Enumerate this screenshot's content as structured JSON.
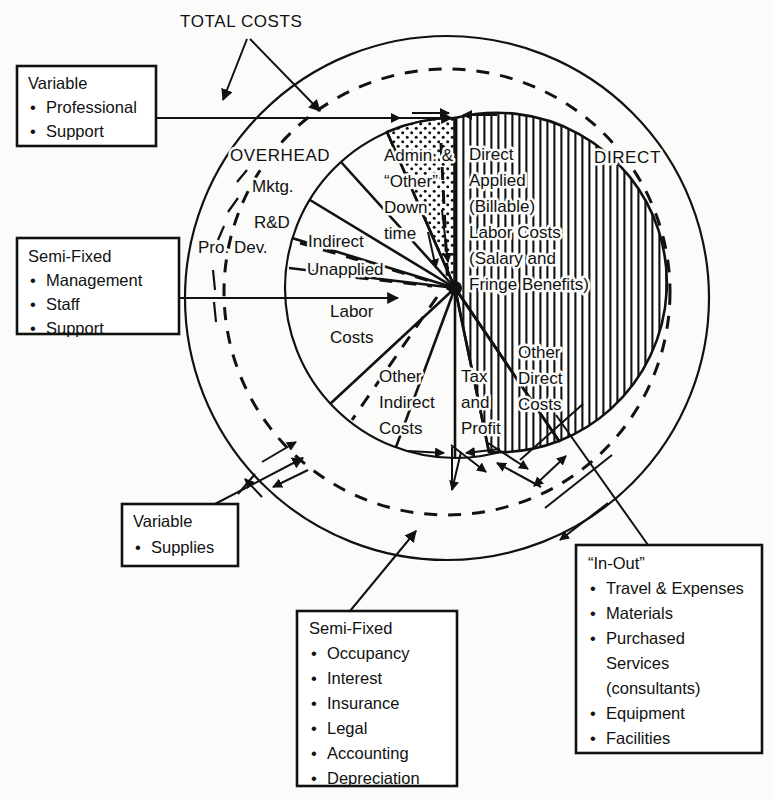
{
  "figure": {
    "title": "TOTAL COSTS",
    "ring_labels": {
      "overhead": "OVERHEAD",
      "direct": "DIRECT"
    }
  },
  "wedge_labels": {
    "mktg": "Mktg.",
    "rnd": "R&D",
    "pro_dev": "Pro. Dev.",
    "indirect": "Indirect",
    "unapplied": "Unapplied",
    "admin_l1": "Admin. &",
    "admin_l2": "“Other”",
    "admin_l3": "Down",
    "admin_l4": "time",
    "direct_applied_l1": "Direct",
    "direct_applied_l2": "Applied",
    "direct_applied_l3": "(Billable)",
    "direct_applied_l4": "Labor Costs",
    "direct_applied_l5": "(Salary and",
    "direct_applied_l6": "Fringe Benefits)",
    "labor_costs_l1": "Labor",
    "labor_costs_l2": "Costs",
    "other_indirect_l1": "Other",
    "other_indirect_l2": "Indirect",
    "other_indirect_l3": "Costs",
    "tax_profit_l1": "Tax",
    "tax_profit_l2": "and",
    "tax_profit_l3": "Profit",
    "other_direct_l1": "Other",
    "other_direct_l2": "Direct",
    "other_direct_l3": "Costs"
  },
  "boxes": [
    {
      "id": "variable-labor",
      "title": "Variable",
      "items": [
        "Professional",
        "Support"
      ]
    },
    {
      "id": "semi-fixed-labor",
      "title": "Semi-Fixed",
      "items": [
        "Management",
        "Staff",
        "Support"
      ]
    },
    {
      "id": "variable-supplies",
      "title": "Variable",
      "items": [
        "Supplies"
      ]
    },
    {
      "id": "semi-fixed-indirect",
      "title": "Semi-Fixed",
      "items": [
        "Occupancy",
        "Interest",
        "Insurance",
        "Legal",
        "Accounting",
        "Depreciation"
      ]
    },
    {
      "id": "in-out",
      "title": "“In-Out”",
      "items": [
        "Travel & Expenses",
        "Materials",
        "Purchased",
        "Services",
        "(consultants)",
        "Equipment",
        "Facilities"
      ]
    }
  ],
  "colors": {
    "ink": "#111111",
    "paper": "#fbfbf9"
  }
}
